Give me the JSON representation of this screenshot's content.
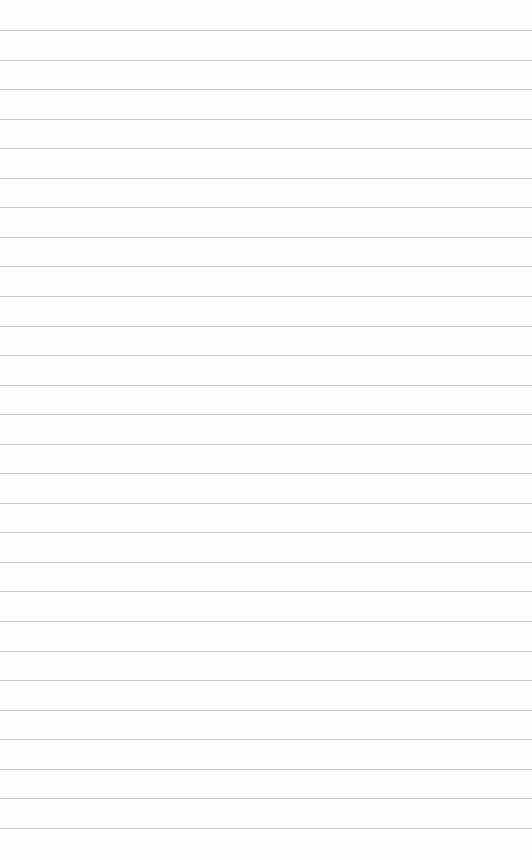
{
  "paper": {
    "type": "lined-paper",
    "background": "#fdfdfd",
    "line_color": "#c9c9c9",
    "line_count": 28,
    "first_line_y": 30,
    "line_spacing": 29.55
  }
}
